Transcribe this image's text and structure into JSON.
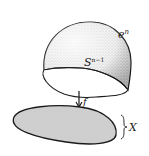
{
  "diagram": {
    "labels": {
      "cell": "e",
      "cell_sup": "n",
      "sphere": "S",
      "sphere_sup": "n−1",
      "map": "f",
      "space": "X"
    },
    "colors": {
      "stroke": "#1a1a1a",
      "hemisphere_fill": "#d9d9d9",
      "stipple": "#8a8a8a",
      "disk_fill": "#cfcfcf",
      "background": "#ffffff"
    }
  }
}
